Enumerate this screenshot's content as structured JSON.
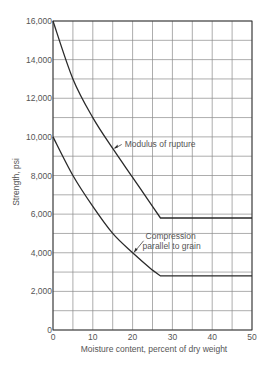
{
  "chart_data": {
    "type": "line",
    "title": "",
    "xlabel": "Moisture content, percent of dry weight",
    "ylabel": "Strength, psi",
    "xlim": [
      0,
      50
    ],
    "ylim": [
      0,
      16000
    ],
    "x_ticks": [
      0,
      10,
      20,
      30,
      40,
      50
    ],
    "x_tick_labels": [
      "0",
      "10",
      "20",
      "30",
      "40",
      "50"
    ],
    "y_ticks": [
      0,
      2000,
      4000,
      6000,
      8000,
      10000,
      12000,
      14000,
      16000
    ],
    "y_tick_labels": [
      "0",
      "2,000",
      "4,000",
      "6,000",
      "8,000",
      "10,000",
      "12,000",
      "14,000",
      "16,000"
    ],
    "grid": {
      "x_step": 5,
      "y_step": 1000,
      "on": true
    },
    "legend": "none (inline annotations)",
    "series": [
      {
        "name": "Modulus of rupture",
        "x": [
          0,
          5,
          10,
          15,
          20,
          25,
          27,
          50
        ],
        "values": [
          16000,
          13000,
          11000,
          9400,
          7900,
          6400,
          5800,
          5800
        ]
      },
      {
        "name": "Compression parallel to grain",
        "x": [
          0,
          5,
          10,
          15,
          20,
          25,
          27,
          50
        ],
        "values": [
          10000,
          8000,
          6400,
          5000,
          4000,
          3100,
          2800,
          2800
        ]
      }
    ],
    "annotations": [
      {
        "text": "Modulus of rupture",
        "arrow_to": [
          15,
          9400
        ]
      },
      {
        "text": "Compression",
        "text2": "parallel to grain",
        "arrow_to": [
          20,
          4000
        ]
      }
    ]
  },
  "colors": {
    "line": "#2a2a2a",
    "grid": "#8a8a8a",
    "text": "#555555"
  }
}
